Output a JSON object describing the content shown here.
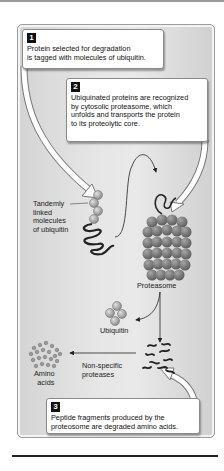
{
  "steps": [
    {
      "number": "1",
      "text_lines": [
        "Protein selected for degradation",
        "is tagged with molecules of ubiquitin."
      ]
    },
    {
      "number": "2",
      "text_lines": [
        "Ubiquinated proteins are recognized",
        "by cytosolic proteasome, which",
        "unfolds and transports the protein",
        "to its proteolytic core."
      ]
    },
    {
      "number": "3",
      "text_lines": [
        "Peptide fragments produced by the",
        "proteosome are degraded amino acids."
      ]
    }
  ],
  "labels": {
    "tandem": [
      "Tandemly",
      "linked",
      "molecules",
      "of ubiquitin"
    ],
    "proteasome": "Proteasome",
    "ubiquitin": "Ubiquitin",
    "proteases": [
      "Non-specific",
      "proteases"
    ],
    "amino": [
      "Amino",
      "acids"
    ]
  },
  "colors": {
    "panel_bg": "#e4e4e4",
    "proteasome": "#8a8a8a",
    "ubiquitin": "#a8a8a8",
    "step_badge": "#111111"
  }
}
